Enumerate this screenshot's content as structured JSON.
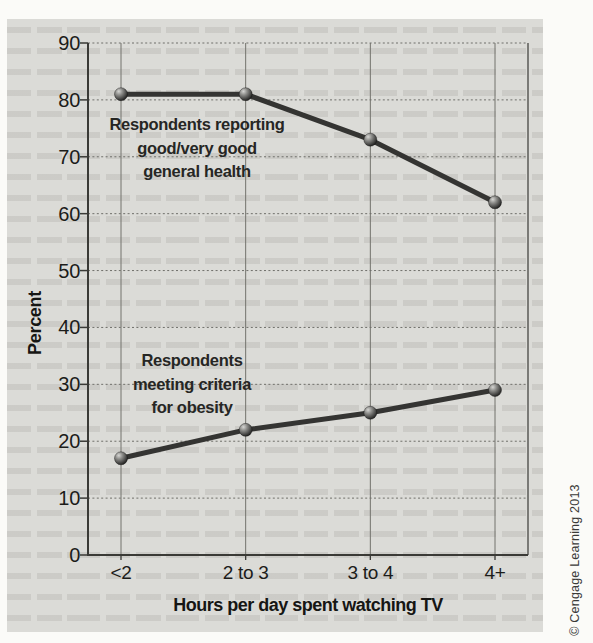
{
  "credit": "© Cengage Learning 2013",
  "colors": {
    "page_bg": "#fbfbf8",
    "panel_bg": "#dbdbd7",
    "grid": "#6f6f6a",
    "axis": "#3a3a36",
    "line": "#343432",
    "marker_highlight": "#d6d6d3",
    "marker_dark": "#0a0a09",
    "text": "#1c1c1a"
  },
  "chart_data": {
    "type": "line",
    "title": "",
    "categories": [
      "<2",
      "2 to 3",
      "3 to 4",
      "4+"
    ],
    "series": [
      {
        "name": "Respondents reporting good/very good general health",
        "values": [
          81,
          81,
          73,
          62
        ]
      },
      {
        "name": "Respondents meeting criteria for obesity",
        "values": [
          17,
          22,
          25,
          29
        ]
      }
    ],
    "xlabel": "Hours per day spent watching TV",
    "ylabel": "Percent",
    "ylim": [
      0,
      90
    ],
    "ytick_step": 10,
    "grid": true,
    "legend": "inline-annotations",
    "annotations": [
      {
        "text": "Respondents reporting\ngood/very good\ngeneral health",
        "series": 0
      },
      {
        "text": "Respondents\nmeeting criteria\nfor obesity",
        "series": 1
      }
    ]
  }
}
